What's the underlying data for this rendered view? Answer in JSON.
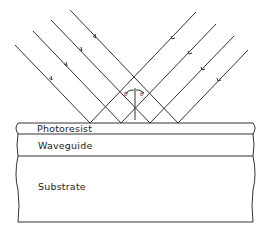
{
  "figure": {
    "layers": [
      {
        "name": "photoresist",
        "label": "Photoresist"
      },
      {
        "name": "waveguide",
        "label": "Waveguide"
      },
      {
        "name": "substrate",
        "label": "Substrate"
      }
    ],
    "angle_labels": {
      "left": "θ",
      "right": "θ"
    },
    "colors": {
      "line": "#333333",
      "background": "#ffffff"
    }
  }
}
